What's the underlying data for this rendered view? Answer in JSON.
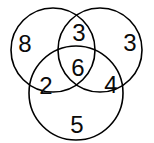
{
  "diagram": {
    "type": "venn-3-set",
    "title": "",
    "background_color": "#ffffff",
    "stroke_color": "#000000",
    "text_color": "#0a0a0a",
    "circles": [
      {
        "name": "top-left-circle",
        "cx": 53,
        "cy": 50,
        "r": 42
      },
      {
        "name": "top-right-circle",
        "cx": 100,
        "cy": 50,
        "r": 42
      },
      {
        "name": "bottom-circle",
        "cx": 76,
        "cy": 93,
        "r": 47
      }
    ],
    "regions": [
      {
        "name": "region-left-only",
        "value": "8",
        "x": 25,
        "y": 44
      },
      {
        "name": "region-top-overlap",
        "value": "3",
        "x": 79,
        "y": 33
      },
      {
        "name": "region-right-only",
        "value": "3",
        "x": 130,
        "y": 43
      },
      {
        "name": "region-left-bottom",
        "value": "2",
        "x": 46,
        "y": 86
      },
      {
        "name": "region-center-all",
        "value": "6",
        "x": 78,
        "y": 68
      },
      {
        "name": "region-right-bottom",
        "value": "4",
        "x": 111,
        "y": 85
      },
      {
        "name": "region-bottom-only",
        "value": "5",
        "x": 77,
        "y": 125
      }
    ]
  },
  "chart_data": {
    "type": "venn",
    "title": "",
    "sets": [
      "A",
      "B",
      "C"
    ],
    "region_labels": {
      "A_only": "8",
      "A_and_B": "3",
      "B_only": "3",
      "A_and_C": "2",
      "A_and_B_and_C": "6",
      "B_and_C": "4",
      "C_only": "5"
    },
    "values": [
      8,
      3,
      3,
      2,
      6,
      4,
      5
    ],
    "categories": [
      "A only",
      "A∩B",
      "B only",
      "A∩C",
      "A∩B∩C",
      "B∩C",
      "C only"
    ],
    "grid": false,
    "legend": "none"
  }
}
